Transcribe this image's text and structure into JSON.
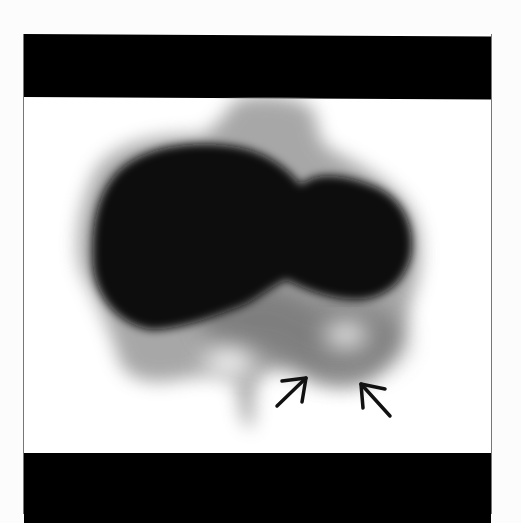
{
  "image": {
    "description": "Nuclear medicine scintigraphy scan with two arrows pointing to a region of reduced uptake",
    "colors": {
      "background": "#ffffff",
      "bands": "#000000",
      "organ_dense": "#0a0a0a",
      "organ_halo": "#9a9a9a",
      "arrow": "#111111"
    },
    "annotations": [
      {
        "type": "arrow",
        "direction": "up-right",
        "x": 290,
        "y": 390
      },
      {
        "type": "arrow",
        "direction": "up-left",
        "x": 373,
        "y": 395
      }
    ]
  }
}
